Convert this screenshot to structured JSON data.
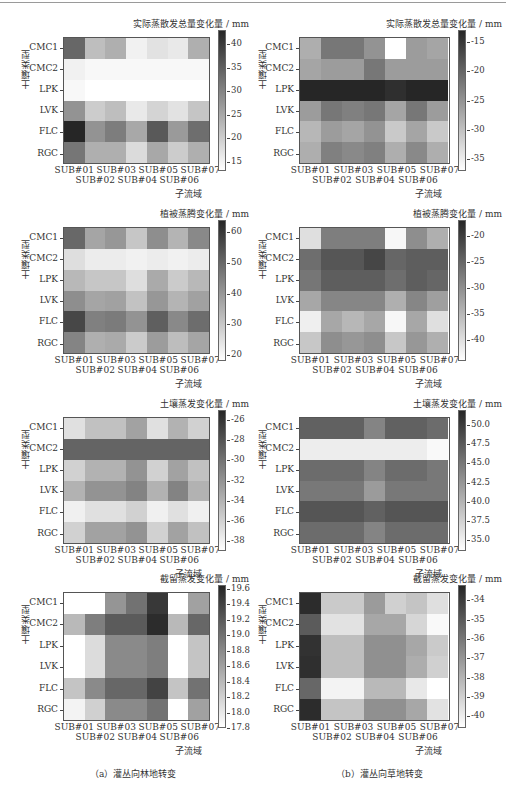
{
  "figure": {
    "captions": [
      "（a）灌丛向林地转变",
      "（b）灌丛向草地转变"
    ]
  },
  "chart_data": [
    {
      "type": "heatmap",
      "column": "a",
      "row": 0,
      "title": "实际蒸散发总量变化量 / mm",
      "xlabel": "子流域",
      "ylabel": "土壤类型",
      "x": [
        "SUB#01",
        "SUB#02",
        "SUB#03",
        "SUB#04",
        "SUB#05",
        "SUB#06",
        "SUB#07"
      ],
      "y": [
        "CMC1",
        "CMC2",
        "LPK",
        "LVK",
        "FLC",
        "RGC"
      ],
      "colorbar_ticks": [
        15,
        20,
        25,
        30,
        35,
        40
      ],
      "vmin": 13,
      "vmax": 43,
      "values": [
        [
          34,
          22,
          24,
          15,
          17,
          16,
          24
        ],
        [
          15,
          14,
          14,
          14,
          14,
          14,
          14
        ],
        [
          14,
          13,
          13,
          13,
          13,
          13,
          13
        ],
        [
          28,
          20,
          22,
          16,
          19,
          17,
          21
        ],
        [
          43,
          28,
          31,
          25,
          36,
          27,
          33
        ],
        [
          32,
          24,
          24,
          18,
          25,
          20,
          24
        ]
      ]
    },
    {
      "type": "heatmap",
      "column": "b",
      "row": 0,
      "title": "实际蒸散发总量变化量 / mm",
      "xlabel": "子流域",
      "ylabel": "土壤类型",
      "x": [
        "SUB#01",
        "SUB#02",
        "SUB#03",
        "SUB#04",
        "SUB#05",
        "SUB#06",
        "SUB#07"
      ],
      "y": [
        "CMC1",
        "CMC2",
        "LPK",
        "LVK",
        "FLC",
        "RGC"
      ],
      "colorbar_ticks": [
        -15,
        -20,
        -25,
        -30,
        -35
      ],
      "vmin": -37,
      "vmax": -13,
      "values": [
        [
          -28,
          -22,
          -22,
          -25,
          -37,
          -26,
          -27
        ],
        [
          -27,
          -26,
          -26,
          -22,
          -26,
          -26,
          -26
        ],
        [
          -13,
          -13,
          -13,
          -13,
          -14,
          -13,
          -13
        ],
        [
          -26,
          -22,
          -23,
          -22,
          -27,
          -22,
          -26
        ],
        [
          -29,
          -26,
          -27,
          -25,
          -31,
          -27,
          -31
        ],
        [
          -28,
          -23,
          -24,
          -23,
          -28,
          -24,
          -28
        ]
      ]
    },
    {
      "type": "heatmap",
      "column": "a",
      "row": 1,
      "title": "植被蒸腾变化量 / mm",
      "xlabel": "子流域",
      "ylabel": "土壤类型",
      "x": [
        "SUB#01",
        "SUB#02",
        "SUB#03",
        "SUB#04",
        "SUB#05",
        "SUB#06",
        "SUB#07"
      ],
      "y": [
        "CMC1",
        "CMC2",
        "LPK",
        "LVK",
        "FLC",
        "RGC"
      ],
      "colorbar_ticks": [
        20,
        30,
        40,
        50,
        60
      ],
      "vmin": 18,
      "vmax": 64,
      "values": [
        [
          50,
          37,
          40,
          30,
          42,
          34,
          43
        ],
        [
          25,
          22,
          22,
          21,
          22,
          21,
          22
        ],
        [
          33,
          30,
          30,
          25,
          36,
          29,
          33
        ],
        [
          42,
          37,
          38,
          31,
          40,
          34,
          38
        ],
        [
          57,
          45,
          46,
          41,
          52,
          43,
          49
        ],
        [
          44,
          35,
          36,
          29,
          39,
          32,
          37
        ]
      ]
    },
    {
      "type": "heatmap",
      "column": "b",
      "row": 1,
      "title": "植被蒸腾变化量 / mm",
      "xlabel": "子流域",
      "ylabel": "土壤类型",
      "x": [
        "SUB#01",
        "SUB#02",
        "SUB#03",
        "SUB#04",
        "SUB#05",
        "SUB#06",
        "SUB#07"
      ],
      "y": [
        "CMC1",
        "CMC2",
        "LPK",
        "LVK",
        "FLC",
        "RGC"
      ],
      "colorbar_ticks": [
        -20,
        -25,
        -30,
        -35,
        -40
      ],
      "vmin": -44,
      "vmax": -17,
      "values": [
        [
          -40,
          -28,
          -28,
          -28,
          -43,
          -30,
          -34
        ],
        [
          -26,
          -23,
          -23,
          -21,
          -25,
          -24,
          -24
        ],
        [
          -27,
          -24,
          -24,
          -24,
          -26,
          -24,
          -25
        ],
        [
          -33,
          -29,
          -29,
          -29,
          -34,
          -29,
          -32
        ],
        [
          -42,
          -33,
          -35,
          -33,
          -43,
          -33,
          -40
        ],
        [
          -37,
          -30,
          -31,
          -30,
          -37,
          -31,
          -34
        ]
      ]
    },
    {
      "type": "heatmap",
      "column": "a",
      "row": 2,
      "title": "土壤蒸发变化量 / mm",
      "xlabel": "子流域",
      "ylabel": "土壤类型",
      "x": [
        "SUB#01",
        "SUB#02",
        "SUB#03",
        "SUB#04",
        "SUB#05",
        "SUB#06",
        "SUB#07"
      ],
      "y": [
        "CMC1",
        "CMC2",
        "LPK",
        "LVK",
        "FLC",
        "RGC"
      ],
      "colorbar_ticks": [
        -26,
        -28,
        -30,
        -32,
        -34,
        -36,
        -38
      ],
      "vmin": -39,
      "vmax": -25,
      "values": [
        [
          -37,
          -35,
          -35,
          -33,
          -37,
          -34,
          -36
        ],
        [
          -29,
          -29,
          -29,
          -29,
          -29,
          -29,
          -29
        ],
        [
          -36,
          -34,
          -34,
          -32,
          -36,
          -33,
          -35
        ],
        [
          -34,
          -32,
          -32,
          -31,
          -34,
          -31,
          -34
        ],
        [
          -38,
          -37,
          -37,
          -36,
          -38,
          -37,
          -38
        ],
        [
          -36,
          -33,
          -33,
          -32,
          -36,
          -33,
          -35
        ]
      ]
    },
    {
      "type": "heatmap",
      "column": "b",
      "row": 2,
      "title": "土壤蒸发变化量 / mm",
      "xlabel": "子流域",
      "ylabel": "土壤类型",
      "x": [
        "SUB#01",
        "SUB#02",
        "SUB#03",
        "SUB#04",
        "SUB#05",
        "SUB#06",
        "SUB#07"
      ],
      "y": [
        "CMC1",
        "CMC2",
        "LPK",
        "LVK",
        "FLC",
        "RGC"
      ],
      "colorbar_ticks": [
        "50.0",
        "47.5",
        "45.0",
        "42.5",
        "40.0",
        "37.5",
        "35.0"
      ],
      "vmin": 33.5,
      "vmax": 52,
      "values": [
        [
          47,
          47,
          47,
          44,
          47,
          47,
          46
        ],
        [
          35,
          35,
          35,
          35,
          35,
          35,
          34
        ],
        [
          46,
          46,
          46,
          44,
          46,
          46,
          45
        ],
        [
          45,
          45,
          45,
          42,
          45,
          45,
          45
        ],
        [
          48,
          48,
          48,
          47,
          48,
          48,
          48
        ],
        [
          46,
          46,
          46,
          44,
          46,
          46,
          46
        ]
      ]
    },
    {
      "type": "heatmap",
      "column": "a",
      "row": 3,
      "title": "截留蒸发变化量 / mm",
      "xlabel": "子流域",
      "ylabel": "土壤类型",
      "x": [
        "SUB#01",
        "SUB#02",
        "SUB#03",
        "SUB#04",
        "SUB#05",
        "SUB#06",
        "SUB#07"
      ],
      "y": [
        "CMC1",
        "CMC2",
        "LPK",
        "LVK",
        "FLC",
        "RGC"
      ],
      "colorbar_ticks": [
        "19.6",
        "19.4",
        "19.2",
        "19.0",
        "18.8",
        "18.6",
        "18.4",
        "18.2",
        "18.0",
        "17.8"
      ],
      "vmin": 17.8,
      "vmax": 19.65,
      "values": [
        [
          17.8,
          17.8,
          18.7,
          19.0,
          19.5,
          17.8,
          18.6
        ],
        [
          18.4,
          18.9,
          19.2,
          19.2,
          19.6,
          18.4,
          19.1
        ],
        [
          17.8,
          18.1,
          18.8,
          18.8,
          18.9,
          17.8,
          18.3
        ],
        [
          17.8,
          18.1,
          18.8,
          18.8,
          18.9,
          17.8,
          18.3
        ],
        [
          18.3,
          18.8,
          19.1,
          19.1,
          19.4,
          18.3,
          19.0
        ],
        [
          17.9,
          18.2,
          18.8,
          18.8,
          19.0,
          17.8,
          18.6
        ]
      ]
    },
    {
      "type": "heatmap",
      "column": "b",
      "row": 3,
      "title": "截留蒸发变化量 / mm",
      "xlabel": "子流域",
      "ylabel": "土壤类型",
      "x": [
        "SUB#01",
        "SUB#02",
        "SUB#03",
        "SUB#04",
        "SUB#05",
        "SUB#06",
        "SUB#07"
      ],
      "y": [
        "CMC1",
        "CMC2",
        "LPK",
        "LVK",
        "FLC",
        "RGC"
      ],
      "colorbar_ticks": [
        -34,
        -35,
        -36,
        -37,
        -38,
        -39,
        -40
      ],
      "vmin": -40.6,
      "vmax": -33.2,
      "values": [
        [
          -33.4,
          -38.8,
          -38.8,
          -37.2,
          -39.0,
          -38.6,
          -39.5
        ],
        [
          -35.0,
          -39.6,
          -39.6,
          -37.6,
          -37.6,
          -39.2,
          -40.4
        ],
        [
          -33.6,
          -38.4,
          -38.4,
          -36.8,
          -36.8,
          -37.6,
          -38.8
        ],
        [
          -33.5,
          -38.4,
          -38.4,
          -36.8,
          -36.8,
          -37.8,
          -39.0
        ],
        [
          -35.4,
          -40.2,
          -40.2,
          -38.2,
          -38.2,
          -39.8,
          -40.6
        ],
        [
          -33.4,
          -38.6,
          -38.6,
          -36.8,
          -36.8,
          -37.6,
          -39.6
        ]
      ]
    }
  ]
}
